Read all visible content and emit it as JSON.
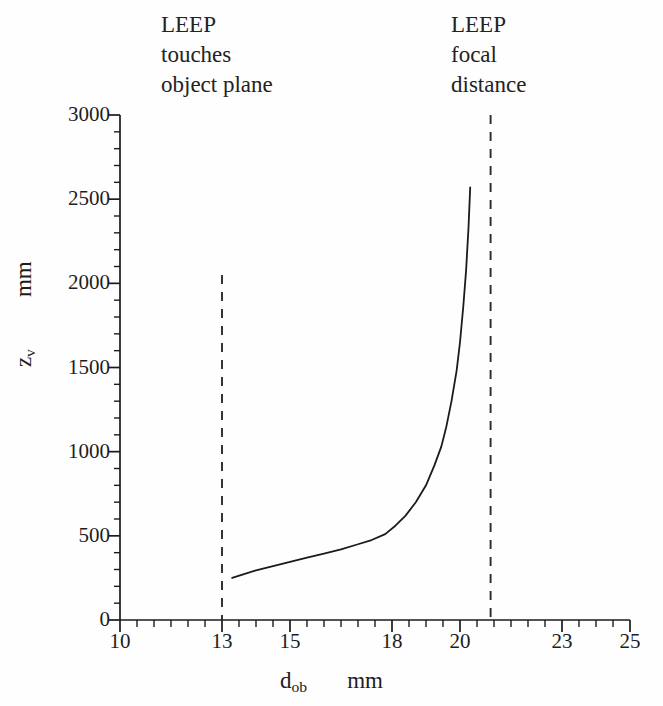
{
  "figure": {
    "background": "#fefefe",
    "ink_color": "#1b1b1b"
  },
  "annotations": {
    "left": {
      "name": "leep-touches-object-plane",
      "line1": "LEEP",
      "line2": "touches",
      "line3": "object plane",
      "points_to_x": 13.0
    },
    "right": {
      "name": "leep-focal-distance",
      "line1": "LEEP",
      "line2": "focal",
      "line3": "distance",
      "points_to_x": 20.9
    }
  },
  "axis_titles": {
    "y_symbol": "z",
    "y_subscript": "v",
    "y_unit": "mm",
    "x_symbol": "d",
    "x_subscript": "ob",
    "x_unit": "mm"
  },
  "chart_data": {
    "type": "line",
    "title": "",
    "subtitle": "",
    "xlabel": "d_ob   mm",
    "ylabel": "z_v   mm",
    "xlim": [
      10,
      25
    ],
    "ylim": [
      0,
      3000
    ],
    "grid": false,
    "legend": false,
    "x_ticks": [
      10,
      13,
      15,
      18,
      20,
      23,
      25
    ],
    "x_tick_labels": [
      "10",
      "13",
      "15",
      "18",
      "20",
      "23",
      "25"
    ],
    "x_minor_step": 0.5,
    "y_ticks": [
      0,
      500,
      1000,
      1500,
      2000,
      2500,
      3000
    ],
    "y_tick_labels": [
      "0",
      "500",
      "1000",
      "1500",
      "2000",
      "2500",
      "3000"
    ],
    "y_minor_step": 100,
    "series": [
      {
        "name": "virtual image distance",
        "style": "solid",
        "color": "#1b1b1b",
        "x": [
          13.3,
          13.6,
          14.0,
          14.5,
          15.0,
          15.5,
          16.0,
          16.5,
          17.0,
          17.4,
          17.8,
          18.1,
          18.4,
          18.7,
          19.0,
          19.25,
          19.45,
          19.6,
          19.75,
          19.9,
          20.0,
          20.1,
          20.18,
          20.25,
          20.3
        ],
        "y": [
          250,
          270,
          295,
          320,
          345,
          370,
          395,
          420,
          450,
          475,
          510,
          560,
          620,
          700,
          800,
          920,
          1030,
          1150,
          1300,
          1480,
          1650,
          1870,
          2080,
          2330,
          2570
        ]
      }
    ],
    "reference_lines": [
      {
        "name": "leep-touches-object-plane-line",
        "orientation": "vertical",
        "x": 13.0,
        "y_from": 0,
        "y_to": 2050,
        "style": "dashed",
        "color": "#2a2a2a"
      },
      {
        "name": "leep-focal-distance-line",
        "orientation": "vertical",
        "x": 20.9,
        "y_from": 0,
        "y_to": 3000,
        "style": "dashed",
        "color": "#2a2a2a"
      }
    ]
  }
}
